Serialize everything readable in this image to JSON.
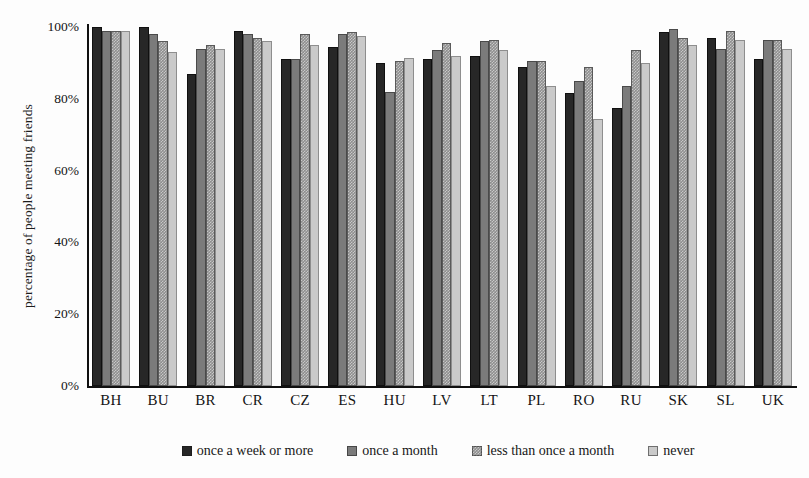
{
  "chart_data": {
    "type": "bar",
    "title": "",
    "xlabel": "",
    "ylabel": "percentage of people meeting friends",
    "ylim": [
      0,
      100
    ],
    "ytick_labels": [
      "100%",
      "80%",
      "60%",
      "40%",
      "20%",
      "0%"
    ],
    "ytick_values": [
      100,
      80,
      60,
      40,
      20,
      0
    ],
    "grid": false,
    "legend_position": "bottom",
    "categories": [
      "BH",
      "BU",
      "BR",
      "CR",
      "CZ",
      "ES",
      "HU",
      "LV",
      "LT",
      "PL",
      "RO",
      "RU",
      "SK",
      "SL",
      "UK"
    ],
    "series": [
      {
        "name": "once a week or more",
        "color": "#272727",
        "values": [
          100,
          100,
          87,
          99,
          91,
          94.5,
          90,
          91,
          92,
          89,
          81.5,
          77.5,
          98.5,
          97,
          91
        ]
      },
      {
        "name": "once a month",
        "color": "#7b7b7b",
        "values": [
          99,
          98,
          94,
          98,
          91,
          98,
          82,
          93.5,
          96,
          90.5,
          85,
          83.5,
          99.5,
          94,
          96.5
        ]
      },
      {
        "name": "less than once a month",
        "color": "#8e8e8e",
        "values": [
          99,
          96,
          95,
          97,
          98,
          98.5,
          90.5,
          95.5,
          96.5,
          90.5,
          89,
          93.5,
          97,
          99,
          96.5
        ]
      },
      {
        "name": "never",
        "color": "#cacaca",
        "values": [
          99,
          93,
          94,
          96,
          95,
          97.5,
          91.5,
          92,
          93.5,
          83.5,
          74.5,
          90,
          95,
          96.5,
          94
        ]
      }
    ]
  }
}
